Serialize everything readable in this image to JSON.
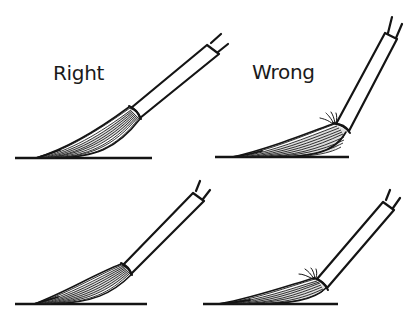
{
  "labels": {
    "right": "Right",
    "wrong": "Wrong"
  },
  "panels": [
    {
      "id": "top-left",
      "verdict": "Right",
      "description": "Brush held at low angle, bristles laid smoothly along paper"
    },
    {
      "id": "top-right",
      "verdict": "Wrong",
      "description": "Brush held too upright, bristles bent and splayed at ferrule"
    },
    {
      "id": "bottom-left",
      "verdict": "Right",
      "description": "Brush at low angle, bristles curve smoothly to tip"
    },
    {
      "id": "bottom-right",
      "verdict": "Wrong",
      "description": "Bristles pressed flat, splaying hairs at ferrule"
    }
  ],
  "colors": {
    "ink": "#141414",
    "background": "#ffffff"
  }
}
